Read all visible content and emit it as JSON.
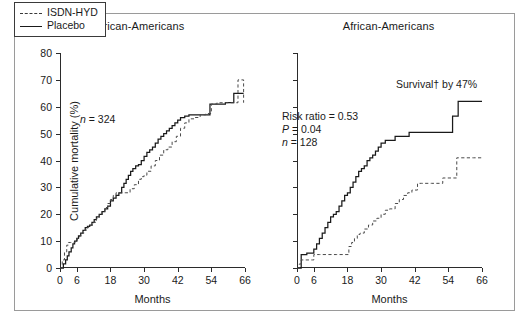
{
  "figure": {
    "background": "#ffffff",
    "frame_color": "#9a9a9a",
    "ink_color": "#1a1a1a"
  },
  "panels": [
    {
      "id": "non-african-americans",
      "title": "Non-African-Americans",
      "annotations": {
        "n_label": "n",
        "n_value": "= 324"
      }
    },
    {
      "id": "african-americans",
      "title": "African-Americans",
      "annotations": {
        "risk_ratio": "Risk ratio = 0.53",
        "p_label": "P",
        "p_value": "= 0.04",
        "n_label": "n",
        "n_value": "= 128",
        "survival": "Survival† by 47%"
      }
    }
  ],
  "legend": {
    "position": "top-left-of-left-panel",
    "entries": [
      {
        "label": "ISDN-HYD",
        "style": "dashed"
      },
      {
        "label": "Placebo",
        "style": "solid"
      }
    ]
  },
  "axes": {
    "ylabel": "Cumulative mortality (%)",
    "xlabel": "Months",
    "yticks": [
      0,
      10,
      20,
      30,
      40,
      50,
      60,
      70,
      80
    ],
    "ylim": [
      0,
      80
    ],
    "xticks": [
      0,
      6,
      18,
      30,
      42,
      54,
      66
    ],
    "xlim": [
      0,
      66
    ],
    "grid": false
  },
  "chart_data": {
    "type": "line",
    "xlabel": "Months",
    "ylabel": "Cumulative mortality (%)",
    "xlim": [
      0,
      66
    ],
    "ylim": [
      0,
      80
    ],
    "xticks": [
      0,
      6,
      18,
      30,
      42,
      54,
      66
    ],
    "yticks": [
      0,
      10,
      20,
      30,
      40,
      50,
      60,
      70,
      80
    ],
    "grid": false,
    "legend_position": "upper-left",
    "step_type": "post",
    "panels": [
      {
        "name": "Non-African-Americans",
        "n": 324,
        "annotations": [
          "n = 324"
        ],
        "series": [
          {
            "name": "Placebo",
            "style": "solid",
            "color": "#1a1a1a",
            "x": [
              0,
              1.2,
              2.0,
              2.6,
              3.2,
              4.0,
              4.6,
              5.2,
              6.0,
              6.6,
              7.4,
              8.2,
              9.0,
              9.8,
              10.6,
              11.4,
              12.2,
              13.0,
              14.0,
              15.0,
              16.0,
              17.0,
              18.0,
              19.0,
              20.0,
              21.0,
              22.0,
              22.8,
              23.6,
              24.4,
              25.2,
              26.0,
              27.0,
              28.0,
              29.0,
              30.0,
              31.0,
              32.0,
              33.0,
              34.0,
              35.0,
              36.0,
              37.0,
              38.0,
              39.0,
              40.0,
              41.0,
              42.0,
              43.0,
              44.5,
              46.0,
              48.0,
              50.5,
              53.5,
              56.0,
              59.0,
              62.0,
              63.5,
              65.5
            ],
            "y": [
              0,
              1.5,
              3.0,
              4.5,
              6.0,
              7.5,
              9.0,
              10.0,
              11.0,
              12.0,
              13.0,
              14.0,
              15.0,
              15.5,
              16.0,
              17.0,
              18.0,
              19.0,
              20.0,
              21.0,
              22.0,
              23.0,
              25.0,
              26.0,
              27.0,
              28.0,
              30.0,
              31.5,
              33.0,
              34.5,
              36.0,
              37.0,
              38.0,
              38.5,
              40.0,
              41.5,
              43.0,
              44.0,
              45.0,
              46.5,
              48.0,
              49.0,
              50.0,
              51.0,
              52.0,
              53.0,
              54.0,
              55.0,
              56.0,
              56.5,
              57.0,
              57.0,
              57.0,
              61.0,
              61.0,
              61.5,
              65.0,
              65.0,
              65.0
            ]
          },
          {
            "name": "ISDN-HYD",
            "style": "dashed",
            "color": "#4a4a4a",
            "x": [
              0,
              0.8,
              1.6,
              2.4,
              3.0,
              3.8,
              4.6,
              5.4,
              6.2,
              7.0,
              7.8,
              8.6,
              9.4,
              10.2,
              11.0,
              12.0,
              13.0,
              14.0,
              15.0,
              16.0,
              17.0,
              18.0,
              19.0,
              20.0,
              21.0,
              22.0,
              23.5,
              25.0,
              26.5,
              28.0,
              29.0,
              30.0,
              31.0,
              32.5,
              34.0,
              35.5,
              37.0,
              38.5,
              40.0,
              41.5,
              43.0,
              44.5,
              46.0,
              48.0,
              50.0,
              52.0,
              54.0,
              56.0,
              58.0,
              60.0,
              62.0,
              63.5,
              65.5
            ],
            "y": [
              0,
              3.0,
              6.0,
              8.5,
              9.5,
              9.5,
              9.5,
              10.0,
              11.0,
              12.0,
              13.0,
              14.0,
              15.0,
              15.5,
              16.0,
              17.0,
              18.5,
              20.0,
              21.0,
              22.5,
              24.0,
              25.5,
              27.0,
              28.0,
              28.0,
              28.0,
              28.0,
              29.5,
              31.0,
              33.0,
              34.0,
              34.5,
              36.0,
              38.0,
              40.0,
              42.0,
              44.0,
              45.0,
              47.0,
              49.0,
              52.0,
              54.0,
              55.5,
              56.0,
              57.0,
              57.5,
              61.0,
              61.5,
              61.5,
              61.5,
              61.5,
              70.0,
              61.5
            ]
          }
        ]
      },
      {
        "name": "African-Americans",
        "n": 128,
        "risk_ratio": 0.53,
        "p_value": 0.04,
        "survival_increase_pct": 47,
        "annotations": [
          "Risk ratio = 0.53",
          "P = 0.04",
          "n = 128",
          "Survival† by 47%"
        ],
        "series": [
          {
            "name": "Placebo",
            "style": "solid",
            "color": "#1a1a1a",
            "x": [
              0,
              1.0,
              1.5,
              2.5,
              3.5,
              5.5,
              6.0,
              7.0,
              8.0,
              9.0,
              10.0,
              11.0,
              12.0,
              13.0,
              14.0,
              15.0,
              16.0,
              17.0,
              18.0,
              19.0,
              20.0,
              21.0,
              22.0,
              23.0,
              24.0,
              25.0,
              26.0,
              27.0,
              28.0,
              29.0,
              30.0,
              31.5,
              33.0,
              35.0,
              38.0,
              40.0,
              44.0,
              48.0,
              52.0,
              55.0,
              55.5,
              56.5,
              57.5,
              60.0,
              63.0,
              66.0
            ],
            "y": [
              0,
              0,
              5.0,
              5.0,
              5.5,
              5.5,
              7.0,
              9.0,
              11.0,
              13.0,
              15.0,
              17.0,
              19.0,
              20.0,
              21.0,
              23.0,
              25.0,
              27.0,
              28.0,
              30.0,
              32.0,
              34.0,
              36.0,
              37.0,
              38.0,
              40.0,
              41.0,
              42.0,
              43.5,
              45.0,
              46.5,
              47.5,
              47.5,
              49.0,
              49.0,
              50.5,
              50.5,
              50.5,
              50.5,
              50.5,
              56.5,
              56.5,
              62.0,
              62.0,
              62.0,
              62.0
            ],
            "final_value": 62
          },
          {
            "name": "ISDN-HYD",
            "style": "dashed",
            "color": "#4a4a4a",
            "x": [
              0,
              0.8,
              1.5,
              5.5,
              6.0,
              8.0,
              11.0,
              14.0,
              17.5,
              18.5,
              19.5,
              20.5,
              21.5,
              22.5,
              24.0,
              25.5,
              27.0,
              28.5,
              30.0,
              31.5,
              33.0,
              35.0,
              36.5,
              38.0,
              39.5,
              41.0,
              43.0,
              44.5,
              48.0,
              52.0,
              55.5,
              57.0,
              60.0,
              63.0,
              66.0
            ],
            "y": [
              0,
              1.5,
              3.0,
              3.0,
              5.0,
              5.0,
              5.0,
              5.0,
              5.0,
              8.0,
              9.5,
              11.0,
              12.5,
              13.0,
              14.5,
              16.0,
              17.5,
              18.5,
              20.0,
              21.5,
              22.0,
              24.0,
              25.5,
              27.0,
              28.0,
              29.0,
              31.5,
              31.5,
              31.5,
              33.5,
              33.5,
              41.0,
              41.0,
              41.0,
              41.0
            ],
            "final_value": 41
          }
        ]
      }
    ]
  }
}
